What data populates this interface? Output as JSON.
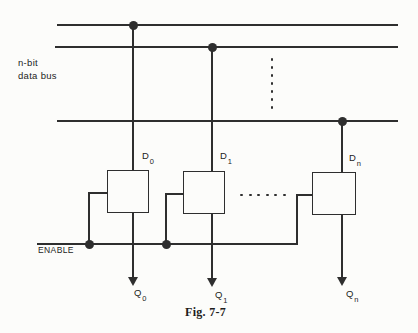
{
  "figure": {
    "caption": "Fig. 7-7",
    "bus_label": {
      "line1": "n-bit",
      "line2": "data bus"
    },
    "enable_label": "ENABLE",
    "colors": {
      "line": "#2e2e2e",
      "text": "#1c1c1c",
      "background": "#fcfcfa"
    }
  },
  "latches": [
    {
      "input_base": "D",
      "input_sub": "0",
      "output_base": "Q",
      "output_sub": "0"
    },
    {
      "input_base": "D",
      "input_sub": "1",
      "output_base": "Q",
      "output_sub": "1"
    },
    {
      "input_base": "D",
      "input_sub": "n",
      "output_base": "Q",
      "output_sub": "n"
    }
  ]
}
